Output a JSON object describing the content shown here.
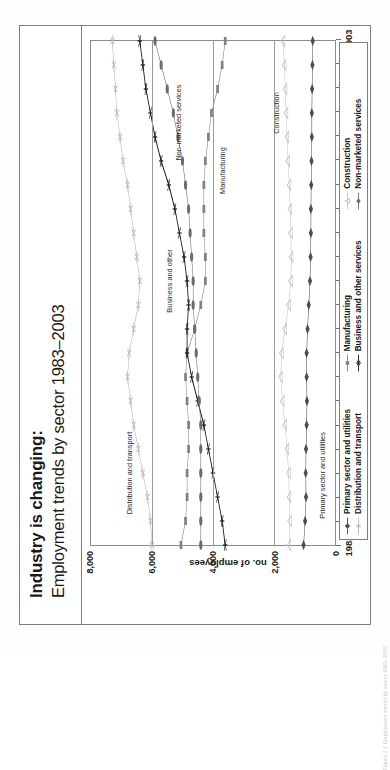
{
  "slide": {
    "title_main": "Industry is changing:",
    "title_sub": "Employment trends by sector 1983–2003"
  },
  "scan": {
    "caption": "Figure 2.1  Employment trends by sector 1983–2003"
  },
  "chart_data": {
    "type": "line",
    "title": "Employment trends by sector 1983–2003",
    "xlabel": "",
    "ylabel": "no. of employees",
    "xlim": [
      1982,
      2003
    ],
    "ylim": [
      0,
      8000
    ],
    "ytick_values": [
      0,
      2000,
      4000,
      6000,
      8000
    ],
    "ytick_labels": [
      "0",
      "2,000",
      "4,000",
      "6,000",
      "8,000"
    ],
    "x": [
      1982,
      1983,
      1984,
      1985,
      1986,
      1987,
      1988,
      1989,
      1990,
      1991,
      1992,
      1993,
      1994,
      1995,
      1996,
      1997,
      1998,
      1999,
      2000,
      2001,
      2002,
      2003
    ],
    "xtick_values": [
      1982,
      1985,
      1988,
      1991,
      1994,
      1997,
      2000,
      2003
    ],
    "xtick_labels": [
      "1982",
      "1985",
      "1988",
      "1991",
      "1994",
      "1997",
      "2000",
      "2003"
    ],
    "grid": "horizontal",
    "legend_position": "bottom",
    "series": [
      {
        "name": "Primary sector and utilities",
        "marker": "diamond",
        "color": "#4d4d4d",
        "values": [
          1030,
          980,
          950,
          960,
          950,
          930,
          920,
          930,
          930,
          900,
          860,
          820,
          800,
          790,
          790,
          780,
          770,
          760,
          760,
          750,
          740,
          730
        ]
      },
      {
        "name": "Distribution and transport",
        "marker": "star",
        "color": "#b8b8b8",
        "values": [
          6000,
          6050,
          6150,
          6300,
          6450,
          6600,
          6700,
          6800,
          6750,
          6600,
          6450,
          6400,
          6500,
          6600,
          6700,
          6800,
          6950,
          7050,
          7150,
          7200,
          7250,
          7300
        ]
      },
      {
        "name": "Manufacturing",
        "marker": "square",
        "color": "#808080",
        "values": [
          5050,
          4900,
          4850,
          4850,
          4800,
          4800,
          4850,
          4900,
          4850,
          4600,
          4400,
          4250,
          4250,
          4300,
          4300,
          4300,
          4250,
          4150,
          4050,
          3850,
          3700,
          3600
        ]
      },
      {
        "name": "Business and other services",
        "marker": "asterisk",
        "color": "#1a1a1a",
        "values": [
          3600,
          3700,
          3850,
          4000,
          4150,
          4300,
          4500,
          4700,
          4850,
          4850,
          4800,
          4850,
          4950,
          5100,
          5250,
          5450,
          5700,
          5900,
          6050,
          6200,
          6300,
          6400
        ]
      },
      {
        "name": "Construction",
        "marker": "triangle",
        "color": "#c2c2c2",
        "values": [
          1500,
          1480,
          1500,
          1520,
          1570,
          1640,
          1720,
          1780,
          1750,
          1640,
          1520,
          1450,
          1430,
          1450,
          1470,
          1500,
          1540,
          1570,
          1600,
          1630,
          1660,
          1700
        ]
      },
      {
        "name": "Non-marketed services",
        "marker": "circle",
        "color": "#6b6b6b",
        "values": [
          4400,
          4400,
          4400,
          4400,
          4400,
          4400,
          4450,
          4500,
          4550,
          4600,
          4650,
          4650,
          4700,
          4750,
          4800,
          4900,
          5000,
          5150,
          5300,
          5500,
          5700,
          5900
        ]
      }
    ],
    "annotations": [
      {
        "text": "Distribution and transport",
        "x": 1985.0,
        "y": 6750
      },
      {
        "text": "Business and other",
        "x": 1993.0,
        "y": 5450
      },
      {
        "text": "Non-marketed services",
        "x": 1999.6,
        "y": 5150
      },
      {
        "text": "Manufacturing",
        "x": 1997.6,
        "y": 3700
      },
      {
        "text": "Construction",
        "x": 2000.0,
        "y": 1950
      },
      {
        "text": "Primary sector and utilities",
        "x": 1984.9,
        "y": 430
      }
    ],
    "legend_columns": [
      [
        "Primary sector and utilities",
        "Distribution and transport"
      ],
      [
        "Manufacturing",
        "Business and other services"
      ],
      [
        "Construction",
        "Non-marketed services"
      ]
    ]
  }
}
